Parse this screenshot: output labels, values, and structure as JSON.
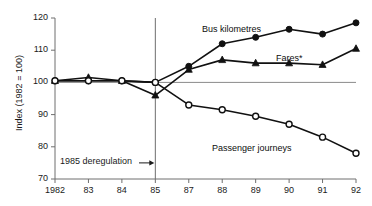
{
  "chart_data": {
    "type": "line",
    "title": "",
    "xlabel": "",
    "ylabel": "Index (1982 = 100)",
    "ylim": [
      70,
      120
    ],
    "yticks": [
      70,
      80,
      90,
      100,
      110,
      120
    ],
    "grid": false,
    "reference_line_y": 100,
    "legend_position": "inline-annotations",
    "x": [
      1982,
      1983,
      1984,
      1985,
      1987,
      1988,
      1989,
      1990,
      1991,
      1992
    ],
    "xtick_labels": [
      "1982",
      "83",
      "84",
      "85",
      "87",
      "88",
      "89",
      "90",
      "91",
      "92"
    ],
    "annotations": [
      {
        "text": "1985 deregulation",
        "arrow": "→",
        "x_category": "85",
        "y_value": 75
      }
    ],
    "vertical_line": {
      "x_category": "85",
      "from": 70,
      "to": 120
    },
    "series": [
      {
        "name": "Bus kilometres",
        "marker": "filled-circle",
        "values": [
          100.5,
          100.5,
          100.5,
          100.0,
          105.0,
          112.0,
          114.0,
          116.5,
          115.0,
          118.5
        ]
      },
      {
        "name": "Fares*",
        "marker": "filled-triangle",
        "values": [
          100.5,
          101.5,
          100.5,
          96.0,
          104.0,
          107.0,
          106.0,
          106.0,
          105.5,
          110.5
        ]
      },
      {
        "name": "Passenger journeys",
        "marker": "open-circle",
        "values": [
          100.5,
          100.5,
          100.5,
          100.0,
          93.0,
          91.5,
          89.5,
          87.0,
          83.0,
          78.0
        ]
      }
    ],
    "series_label_positions": [
      {
        "name": "Bus kilometres",
        "left": 202,
        "top": 24
      },
      {
        "name": "Fares*",
        "left": 276,
        "top": 53
      },
      {
        "name": "Passenger journeys",
        "left": 212,
        "top": 143
      }
    ],
    "colors": {
      "line": "#111111",
      "axis": "#6e6e6e",
      "reference_line": "#8a8a8a",
      "text": "#1a1a1a",
      "background": "#ffffff"
    }
  }
}
